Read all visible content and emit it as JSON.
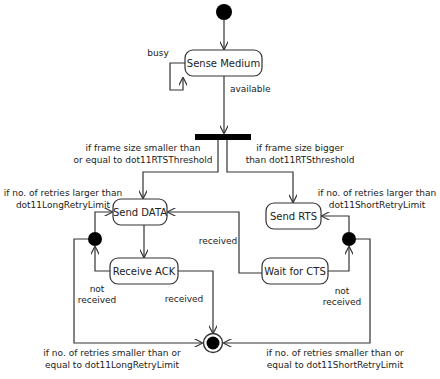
{
  "diagram": {
    "type": "UML activity diagram",
    "colors": {
      "line": "#333333",
      "node_fill": "#000000",
      "state_fill": "#ffffff",
      "text": "#222222"
    },
    "states": {
      "sense_medium": "Sense Medium",
      "send_data": "Send DATA",
      "receive_ack": "Receive ACK",
      "send_rts": "Send RTS",
      "wait_cts": "Wait for CTS"
    },
    "labels": {
      "busy": "busy",
      "available": "available",
      "small_frame": [
        "if frame size smaller than",
        "or equal to dot11RTSThreshold"
      ],
      "big_frame": [
        "if frame size bigger",
        "than dot11RTSthreshold"
      ],
      "long_retry_exceeded": [
        "if no. of retries larger than",
        "dot11LongRetryLimit"
      ],
      "short_retry_exceeded": [
        "if no. of retries larger than",
        "dot11ShortRetryLimit"
      ],
      "ack_received": "received",
      "ack_not_received": [
        "not",
        "received"
      ],
      "cts_received": "received",
      "cts_not_received": [
        "not",
        "received"
      ],
      "long_retry_ok": [
        "if no. of retries smaller than or",
        "equal to dot11LongRetryLimit"
      ],
      "short_retry_ok": [
        "if no. of retries smaller than or",
        "equal to dot11ShortRetryLimit"
      ]
    }
  }
}
